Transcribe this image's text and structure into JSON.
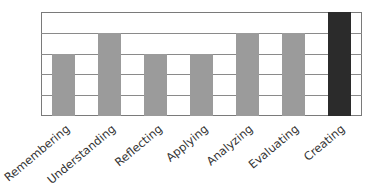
{
  "chart_data": {
    "type": "bar",
    "title": "",
    "xlabel": "",
    "ylabel": "",
    "categories": [
      "Remembering",
      "Understanding",
      "Reflecting",
      "Applying",
      "Analyzing",
      "Evaluating",
      "Creating"
    ],
    "values": [
      3,
      4,
      3,
      3,
      4,
      4,
      5
    ],
    "ylim": [
      0,
      5
    ],
    "grid": true,
    "y_tick_labels_visible": false,
    "legend": null,
    "colors": {
      "default_bar": "#9b9b9b",
      "highlight_bar": "#2b2b2b",
      "gridline": "#8a8a8a",
      "frame": "#7a7a7a"
    },
    "highlighted_category": "Creating"
  }
}
